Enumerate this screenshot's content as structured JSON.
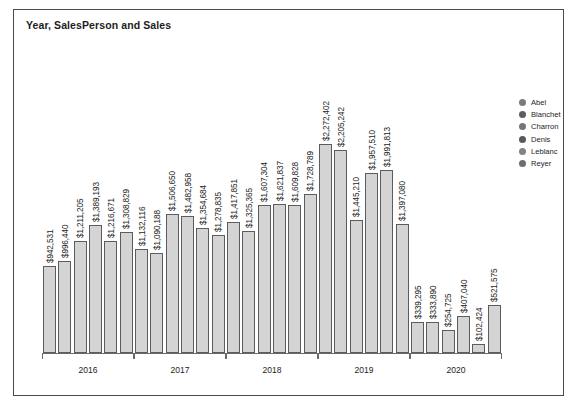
{
  "chart_data": {
    "type": "bar",
    "title": "Year, SalesPerson and Sales",
    "xlabel": "",
    "ylabel": "",
    "grid": false,
    "legend_position": "right",
    "ylim": [
      0,
      2400000
    ],
    "categories": [
      "2016",
      "2017",
      "2018",
      "2019",
      "2020"
    ],
    "series": [
      {
        "name": "Abel",
        "color": "#7a7a7a",
        "values": [
          942531,
          1132116,
          1417851,
          2272402,
          339295
        ],
        "labels": [
          "$942,531",
          "$1,132,116",
          "$1,417,851",
          "$2,272,402",
          "$339,295"
        ]
      },
      {
        "name": "Blanchet",
        "color": "#5e5e5e",
        "values": [
          996440,
          1090188,
          1325365,
          2205242,
          333890
        ],
        "labels": [
          "$996,440",
          "$1,090,188",
          "$1,325,365",
          "$2,205,242",
          "$333,890"
        ]
      },
      {
        "name": "Charron",
        "color": "#767676",
        "values": [
          1211205,
          1506650,
          1607304,
          1445210,
          254725
        ],
        "labels": [
          "$1,211,205",
          "$1,506,650",
          "$1,607,304",
          "$1,445,210",
          "$254,725"
        ]
      },
      {
        "name": "Denis",
        "color": "#5a5a5a",
        "values": [
          1389193,
          1482958,
          1621837,
          1957510,
          407040
        ],
        "labels": [
          "$1,389,193",
          "$1,482,958",
          "$1,621,837",
          "$1,957,510",
          "$407,040"
        ]
      },
      {
        "name": "Leblanc",
        "color": "#828282",
        "values": [
          1216671,
          1354684,
          1609828,
          1991813,
          102424
        ],
        "labels": [
          "$1,216,671",
          "$1,354,684",
          "$1,609,828",
          "$1,991,813",
          "$102,424"
        ]
      },
      {
        "name": "Reyer",
        "color": "#6e6e6e",
        "values": [
          1308829,
          1278835,
          1728789,
          1397080,
          521575
        ],
        "labels": [
          "$1,308,829",
          "$1,278,835",
          "$1,728,789",
          "$1,397,080",
          "$521,575"
        ]
      }
    ]
  },
  "legend": {
    "items": [
      {
        "label": "Abel",
        "color": "#7a7a7a"
      },
      {
        "label": "Blanchet",
        "color": "#5e5e5e"
      },
      {
        "label": "Charron",
        "color": "#767676"
      },
      {
        "label": "Denis",
        "color": "#5a5a5a"
      },
      {
        "label": "Leblanc",
        "color": "#828282"
      },
      {
        "label": "Reyer",
        "color": "#6e6e6e"
      }
    ]
  },
  "style": {
    "bar_fill": "#d4d4d4",
    "bar_stroke": "#5c5c5c",
    "axis_color": "#6a6a6a",
    "text_color": "#1d1d1d",
    "card_border": "#4a4a4a"
  }
}
